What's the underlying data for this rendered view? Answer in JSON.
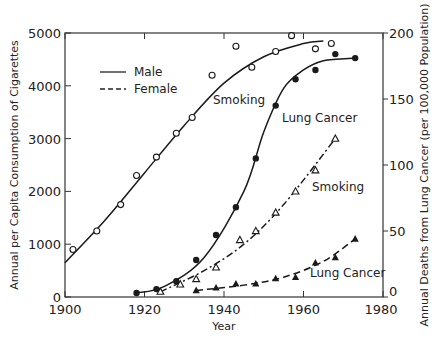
{
  "chart_data": {
    "type": "line",
    "title": "",
    "xlabel": "Year",
    "ylabel_left": "Annual per Capita Consumption of Cigarettes",
    "ylabel_right": "Annual Deaths from Lung Cancer (per 100,000 Population)",
    "xlim": [
      1900,
      1980
    ],
    "ylim_left": [
      0,
      5000
    ],
    "ylim_right": [
      0,
      200
    ],
    "x_ticks": [
      1900,
      1920,
      1940,
      1960,
      1980
    ],
    "y_ticks_left": [
      0,
      1000,
      2000,
      3000,
      4000,
      5000
    ],
    "y_ticks_right": [
      0,
      50,
      100,
      150,
      200
    ],
    "grid": false,
    "legend": {
      "position": "upper-left",
      "entries": [
        {
          "label": "Male",
          "style": "solid"
        },
        {
          "label": "Female",
          "style": "dashed"
        }
      ]
    },
    "annotations": [
      {
        "text": "Smoking",
        "near": "male smoking curve"
      },
      {
        "text": "Lung Cancer",
        "near": "male lung cancer curve"
      },
      {
        "text": "Smoking",
        "near": "female smoking curve"
      },
      {
        "text": "Lung Cancer",
        "near": "female lung cancer curve"
      }
    ],
    "series": [
      {
        "name": "Male Smoking",
        "axis": "left",
        "line": "solid",
        "marker": "open-circle",
        "points": [
          [
            1902,
            900
          ],
          [
            1908,
            1250
          ],
          [
            1914,
            1750
          ],
          [
            1918,
            2300
          ],
          [
            1923,
            2650
          ],
          [
            1928,
            3100
          ],
          [
            1932,
            3400
          ],
          [
            1937,
            4200
          ],
          [
            1943,
            4750
          ],
          [
            1947,
            4350
          ],
          [
            1953,
            4650
          ],
          [
            1957,
            4950
          ],
          [
            1963,
            4700
          ],
          [
            1967,
            4800
          ]
        ],
        "fit": [
          [
            1900,
            650
          ],
          [
            1910,
            1450
          ],
          [
            1920,
            2350
          ],
          [
            1930,
            3250
          ],
          [
            1940,
            4050
          ],
          [
            1950,
            4550
          ],
          [
            1960,
            4800
          ],
          [
            1965,
            4850
          ]
        ]
      },
      {
        "name": "Male Lung Cancer",
        "axis": "right",
        "line": "solid",
        "marker": "filled-circle",
        "points": [
          [
            1918,
            3
          ],
          [
            1923,
            6
          ],
          [
            1928,
            12
          ],
          [
            1933,
            28
          ],
          [
            1938,
            47
          ],
          [
            1943,
            68
          ],
          [
            1948,
            105
          ],
          [
            1953,
            145
          ],
          [
            1958,
            165
          ],
          [
            1963,
            172
          ],
          [
            1968,
            184
          ],
          [
            1973,
            181
          ]
        ],
        "fit": [
          [
            1918,
            3
          ],
          [
            1925,
            8
          ],
          [
            1935,
            30
          ],
          [
            1945,
            80
          ],
          [
            1950,
            125
          ],
          [
            1955,
            158
          ],
          [
            1960,
            172
          ],
          [
            1965,
            179
          ],
          [
            1973,
            181
          ]
        ]
      },
      {
        "name": "Female Smoking",
        "axis": "left",
        "line": "dash-dot",
        "marker": "open-triangle",
        "points": [
          [
            1924,
            100
          ],
          [
            1929,
            240
          ],
          [
            1933,
            340
          ],
          [
            1938,
            560
          ],
          [
            1944,
            1080
          ],
          [
            1948,
            1250
          ],
          [
            1953,
            1600
          ],
          [
            1958,
            2000
          ],
          [
            1963,
            2400
          ],
          [
            1968,
            3000
          ]
        ],
        "fit": [
          [
            1924,
            100
          ],
          [
            1935,
            500
          ],
          [
            1945,
            1000
          ],
          [
            1955,
            1750
          ],
          [
            1968,
            3000
          ]
        ]
      },
      {
        "name": "Female Lung Cancer",
        "axis": "right",
        "line": "dashed",
        "marker": "filled-triangle",
        "points": [
          [
            1933,
            5
          ],
          [
            1938,
            7
          ],
          [
            1943,
            10
          ],
          [
            1948,
            10
          ],
          [
            1953,
            14
          ],
          [
            1958,
            15
          ],
          [
            1963,
            26
          ],
          [
            1968,
            30
          ],
          [
            1973,
            44
          ]
        ],
        "fit": [
          [
            1933,
            5
          ],
          [
            1945,
            9
          ],
          [
            1955,
            15
          ],
          [
            1965,
            27
          ],
          [
            1973,
            44
          ]
        ]
      }
    ]
  },
  "labels": {
    "x_title": "Year",
    "y_left_title": "Annual per Capita Consumption of Cigarettes",
    "y_right_title": "Annual Deaths from Lung Cancer (per 100,000 Population)",
    "legend_male": "Male",
    "legend_female": "Female",
    "annot_male_smoking": "Smoking",
    "annot_male_cancer": "Lung Cancer",
    "annot_female_smoking": "Smoking",
    "annot_female_cancer": "Lung Cancer"
  }
}
